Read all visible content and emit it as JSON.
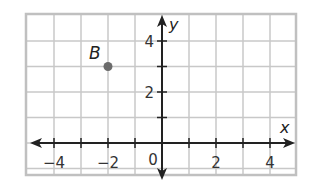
{
  "chart_data": {
    "type": "scatter",
    "title": "",
    "xlabel": "x",
    "ylabel": "y",
    "xlim": [
      -5,
      5
    ],
    "ylim": [
      -1.2,
      5
    ],
    "grid": true,
    "x_ticks": [
      -4,
      -2,
      0,
      2,
      4
    ],
    "x_tick_labels": [
      "−4",
      "−2",
      "0",
      "2",
      "4"
    ],
    "y_ticks": [
      2,
      4
    ],
    "y_tick_labels": [
      "2",
      "4"
    ],
    "origin_label": "0",
    "points": [
      {
        "label": "B",
        "x": -2,
        "y": 3
      }
    ],
    "colors": {
      "grid": "#c8c8c8",
      "border": "#c0c0c0",
      "axis": "#222222",
      "point": "#6b6b6b"
    }
  }
}
